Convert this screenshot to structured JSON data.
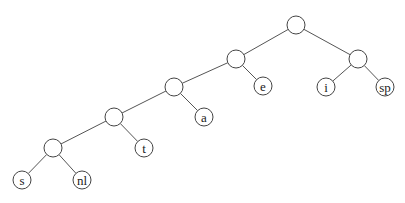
{
  "diagram": {
    "type": "binary-tree",
    "node_radius": 9,
    "colors": {
      "background": "#ffffff",
      "stroke": "#444444",
      "edge": "#555555",
      "text": "#222222"
    },
    "nodes": [
      {
        "id": "root",
        "label": "",
        "x": 296,
        "y": 25
      },
      {
        "id": "n1",
        "label": "",
        "x": 236,
        "y": 59
      },
      {
        "id": "n_isp",
        "label": "",
        "x": 358,
        "y": 59
      },
      {
        "id": "n2",
        "label": "",
        "x": 174,
        "y": 87
      },
      {
        "id": "e",
        "label": "e",
        "x": 263,
        "y": 86
      },
      {
        "id": "i",
        "label": "i",
        "x": 326,
        "y": 87
      },
      {
        "id": "sp",
        "label": "sp",
        "x": 385,
        "y": 87
      },
      {
        "id": "n3",
        "label": "",
        "x": 114,
        "y": 117
      },
      {
        "id": "a",
        "label": "a",
        "x": 204,
        "y": 117
      },
      {
        "id": "n4",
        "label": "",
        "x": 53,
        "y": 148
      },
      {
        "id": "t",
        "label": "t",
        "x": 144,
        "y": 148
      },
      {
        "id": "s",
        "label": "s",
        "x": 22,
        "y": 180
      },
      {
        "id": "nl",
        "label": "nl",
        "x": 82,
        "y": 180
      }
    ],
    "edges": [
      [
        "root",
        "n1"
      ],
      [
        "root",
        "n_isp"
      ],
      [
        "n1",
        "n2"
      ],
      [
        "n1",
        "e"
      ],
      [
        "n_isp",
        "i"
      ],
      [
        "n_isp",
        "sp"
      ],
      [
        "n2",
        "n3"
      ],
      [
        "n2",
        "a"
      ],
      [
        "n3",
        "n4"
      ],
      [
        "n3",
        "t"
      ],
      [
        "n4",
        "s"
      ],
      [
        "n4",
        "nl"
      ]
    ]
  }
}
